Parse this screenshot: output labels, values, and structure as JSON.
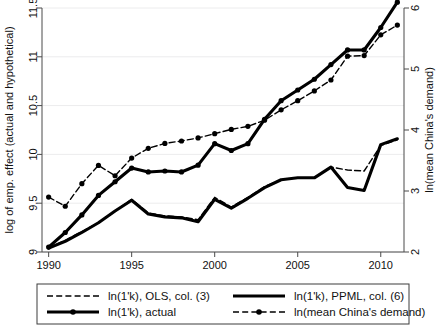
{
  "chart_data": {
    "type": "line",
    "title": "",
    "xlabel": "",
    "ylabel": "log of emp. effect (actual and hypothetical)",
    "y2label": "ln(mean China's demand)",
    "xlim": [
      1989.6,
      2011.4
    ],
    "ylim": [
      9.0,
      11.5
    ],
    "y2lim": [
      2.0,
      6.0
    ],
    "grid": true,
    "legend_position": "bottom",
    "xticks": [
      1990,
      1995,
      2000,
      2005,
      2010
    ],
    "xtick_labels": [
      "1990",
      "1995",
      "2000",
      "2005",
      "2010"
    ],
    "yticks": [
      9,
      9.5,
      10,
      10.5,
      11,
      11.5
    ],
    "ytick_labels": [
      "9",
      "9.5",
      "10",
      "10.5",
      "11",
      "11.5"
    ],
    "y2ticks": [
      2,
      3,
      4,
      5,
      6
    ],
    "y2tick_labels": [
      "2",
      "3",
      "4",
      "5",
      "6"
    ],
    "x": [
      1990,
      1991,
      1992,
      1993,
      1994,
      1995,
      1996,
      1997,
      1998,
      1999,
      2000,
      2001,
      2002,
      2003,
      2004,
      2005,
      2006,
      2007,
      2008,
      2009,
      2010,
      2011
    ],
    "series": [
      {
        "name": "ln(1'k), OLS, col. (3)",
        "axis": "left",
        "style": "dashed",
        "markers": false,
        "values": [
          9.04,
          9.12,
          9.21,
          9.3,
          9.42,
          9.54,
          9.4,
          9.37,
          9.36,
          9.33,
          9.56,
          9.46,
          9.56,
          9.67,
          9.74,
          9.76,
          9.76,
          9.87,
          9.84,
          9.83,
          10.09,
          10.15
        ]
      },
      {
        "name": "ln(1'k), PPML, col. (6)",
        "axis": "left",
        "style": "solid",
        "markers": false,
        "values": [
          9.04,
          9.11,
          9.2,
          9.3,
          9.42,
          9.53,
          9.39,
          9.36,
          9.35,
          9.31,
          9.54,
          9.45,
          9.55,
          9.66,
          9.74,
          9.76,
          9.76,
          9.87,
          9.66,
          9.63,
          10.1,
          10.16
        ]
      },
      {
        "name": "ln(1'k), actual",
        "axis": "left",
        "style": "solid",
        "markers": true,
        "values": [
          9.05,
          9.2,
          9.38,
          9.58,
          9.72,
          9.86,
          9.82,
          9.83,
          9.82,
          9.89,
          10.11,
          10.04,
          10.11,
          10.36,
          10.55,
          10.66,
          10.77,
          10.92,
          11.07,
          11.07,
          11.3,
          11.56
        ]
      },
      {
        "name": "ln(mean China's demand)",
        "axis": "right",
        "style": "dashed",
        "markers": true,
        "values": [
          2.9,
          2.75,
          3.12,
          3.42,
          3.25,
          3.54,
          3.7,
          3.78,
          3.82,
          3.87,
          3.94,
          4.01,
          4.06,
          4.16,
          4.33,
          4.48,
          4.64,
          4.82,
          5.21,
          5.22,
          5.56,
          5.72
        ]
      }
    ]
  },
  "legend": {
    "items": [
      {
        "label": "ln(1'k), OLS, col. (3)",
        "style": "dashed",
        "marker": false,
        "thick": false
      },
      {
        "label": "ln(1'k), PPML, col. (6)",
        "style": "solid",
        "marker": false,
        "thick": true
      },
      {
        "label": "ln(1'k), actual",
        "style": "solid",
        "marker": true,
        "thick": true
      },
      {
        "label": "ln(mean China's demand)",
        "style": "dashed",
        "marker": true,
        "thick": false
      }
    ]
  },
  "colors": {
    "line": "#000000",
    "axis": "#4a4a4a",
    "grid": "#ececed",
    "background": "#ffffff"
  }
}
